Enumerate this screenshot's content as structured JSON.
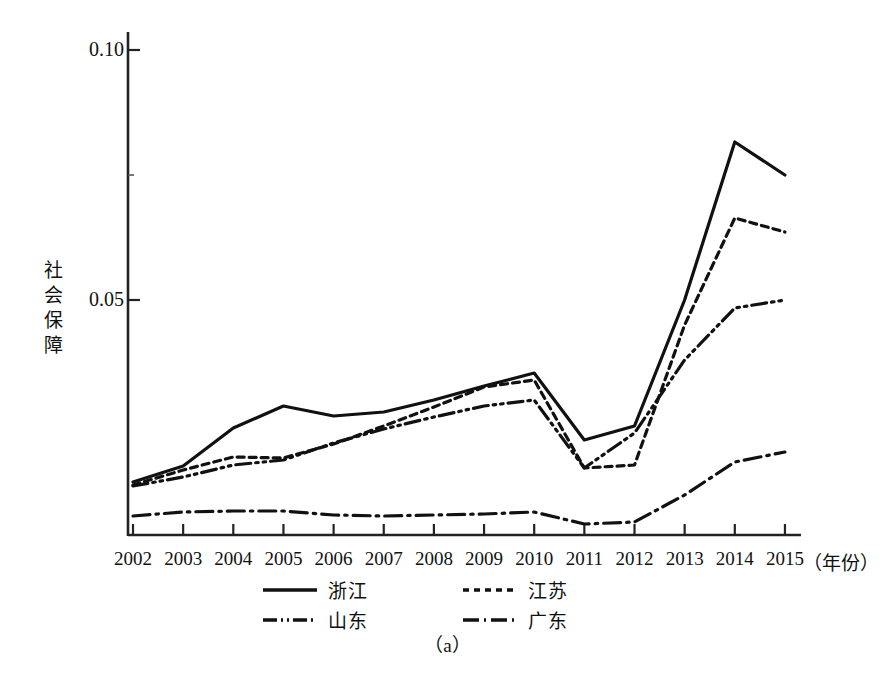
{
  "figure": {
    "caption": "（a）",
    "y_axis_title": "社会保障",
    "y_axis_title_chars": [
      "社",
      "会",
      "保",
      "障"
    ],
    "x_axis_title": "（年份）",
    "y_tick_labels": [
      "0.10",
      "0.05"
    ]
  },
  "legend": {
    "items": [
      {
        "label": "浙江",
        "style": "solid",
        "key": "zhejiang"
      },
      {
        "label": "江苏",
        "style": "dotted",
        "key": "jiangsu"
      },
      {
        "label": "山东",
        "style": "dash-dot-dot",
        "key": "shandong"
      },
      {
        "label": "广东",
        "style": "dash-dot",
        "key": "guangdong"
      }
    ]
  },
  "chart_data": {
    "type": "line",
    "title": "",
    "subtitle": "",
    "xlabel": "（年份）",
    "ylabel": "社会保障",
    "grid": false,
    "legend_position": "bottom",
    "xlim": [
      2002,
      2015
    ],
    "ylim": [
      0.003,
      0.1055
    ],
    "yticks": [
      0.05,
      0.1
    ],
    "ytick_labels": [
      "0.05",
      "0.10"
    ],
    "categories": [
      "2002",
      "2003",
      "2004",
      "2005",
      "2006",
      "2007",
      "2008",
      "2009",
      "2010",
      "2011",
      "2012",
      "2013",
      "2014",
      "2015"
    ],
    "x": [
      2002,
      2003,
      2004,
      2005,
      2006,
      2007,
      2008,
      2009,
      2010,
      2011,
      2012,
      2013,
      2014,
      2015
    ],
    "series": [
      {
        "name": "浙江",
        "name_en": "Zhejiang",
        "style": "solid",
        "values": [
          0.0136,
          0.0168,
          0.0244,
          0.0288,
          0.0268,
          0.0276,
          0.03,
          0.0328,
          0.0354,
          0.022,
          0.0248,
          0.05,
          0.0816,
          0.075
        ]
      },
      {
        "name": "江苏",
        "name_en": "Jiangsu",
        "style": "dotted",
        "values": [
          0.013,
          0.016,
          0.0186,
          0.0184,
          0.0212,
          0.0248,
          0.0286,
          0.0326,
          0.034,
          0.0164,
          0.017,
          0.045,
          0.0664,
          0.0636
        ]
      },
      {
        "name": "山东",
        "name_en": "Shandong",
        "style": "dash-dot-dot",
        "values": [
          0.0128,
          0.0146,
          0.017,
          0.018,
          0.0214,
          0.0242,
          0.0266,
          0.0288,
          0.03,
          0.0164,
          0.0234,
          0.038,
          0.0484,
          0.05
        ]
      },
      {
        "name": "广东",
        "name_en": "Guangdong",
        "style": "dash-dot",
        "values": [
          0.0068,
          0.0076,
          0.0078,
          0.0078,
          0.007,
          0.0068,
          0.007,
          0.0072,
          0.0076,
          0.0052,
          0.0056,
          0.011,
          0.0176,
          0.0196
        ]
      }
    ]
  }
}
